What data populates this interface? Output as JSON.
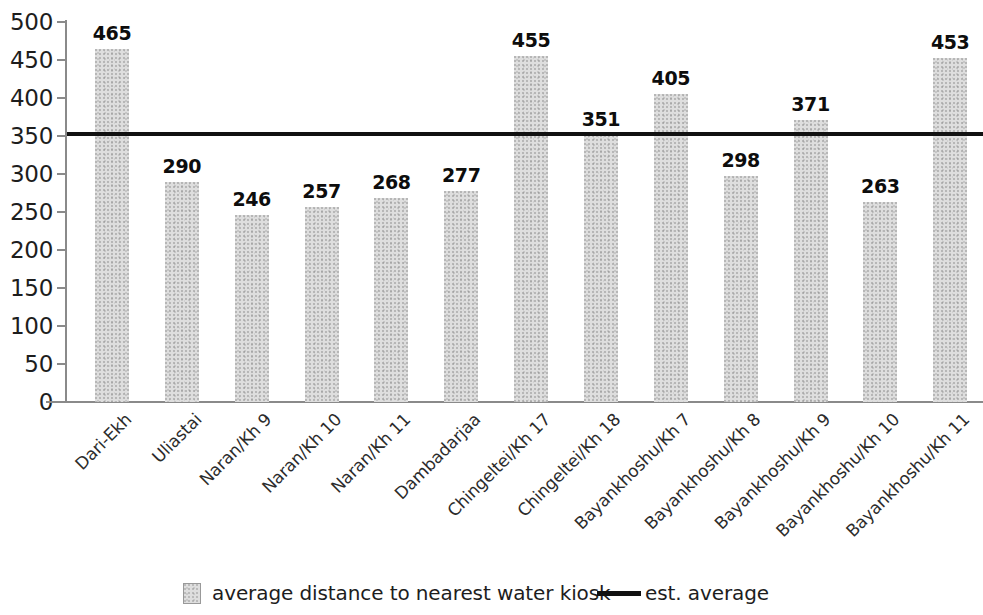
{
  "chart_data": {
    "type": "bar",
    "title": "",
    "subtitle": "",
    "xlabel": "",
    "ylabel": "",
    "ylim": [
      0,
      500
    ],
    "ytick_step": 50,
    "yticks": [
      "0",
      "50",
      "100",
      "150",
      "200",
      "250",
      "300",
      "350",
      "400",
      "450",
      "500"
    ],
    "grid": false,
    "legend_position": "bottom",
    "categories": [
      "Dari-Ekh",
      "Uliastai",
      "Naran/Kh 9",
      "Naran/Kh 10",
      "Naran/Kh 11",
      "Dambadarjaa",
      "Chingeltei/Kh 17",
      "Chingeltei/Kh 18",
      "Bayankhoshu/Kh 7",
      "Bayankhoshu/Kh 8",
      "Bayankhoshu/Kh 9",
      "Bayankhoshu/Kh 10",
      "Bayankhoshu/Kh 11"
    ],
    "values": [
      465,
      290,
      246,
      257,
      268,
      277,
      455,
      351,
      405,
      298,
      371,
      263,
      453
    ],
    "value_labels": [
      "465",
      "290",
      "246",
      "257",
      "268",
      "277",
      "455",
      "351",
      "405",
      "298",
      "371",
      "263",
      "453"
    ],
    "series": [
      {
        "name": "average distance to nearest water kiosk",
        "type": "bar",
        "color": "#dedede",
        "values": [
          465,
          290,
          246,
          257,
          268,
          277,
          455,
          351,
          405,
          298,
          371,
          263,
          453
        ]
      },
      {
        "name": "est. average",
        "type": "hline",
        "color": "#111111",
        "value": 353
      }
    ],
    "reference_line": {
      "label": "est. average",
      "value": 353
    }
  },
  "legend": {
    "items": [
      {
        "label": "average distance to nearest water kiosk",
        "marker": "swatch"
      },
      {
        "label": "est. average",
        "marker": "line"
      }
    ]
  },
  "colors": {
    "bar_fill": "#dedece",
    "reference_line": "#111111",
    "axis": "#8a8a8a",
    "text": "#1d1d1d",
    "background": "#ffffff"
  }
}
